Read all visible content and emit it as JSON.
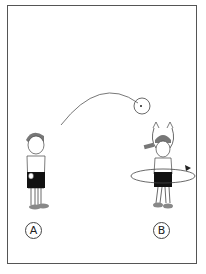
{
  "figure": {
    "labels": {
      "a": "A",
      "b": "B"
    },
    "colors": {
      "stroke": "#444444",
      "shorts": "#111111",
      "skin": "#ffffff",
      "hair": "#777777"
    }
  }
}
